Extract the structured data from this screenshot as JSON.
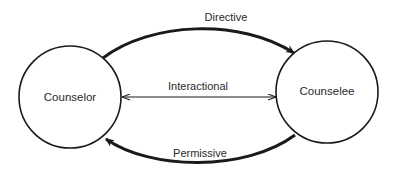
{
  "diagram": {
    "nodes": [
      {
        "id": "counselor",
        "label": "Counselor"
      },
      {
        "id": "counselee",
        "label": "Counselee"
      }
    ],
    "edges": [
      {
        "id": "directive",
        "label": "Directive",
        "from": "counselor",
        "to": "counselee",
        "style": "thick-arc-top"
      },
      {
        "id": "interactional",
        "label": "Interactional",
        "from": "counselor",
        "to": "counselee",
        "style": "thin-double-headed"
      },
      {
        "id": "permissive",
        "label": "Permissive",
        "from": "counselee",
        "to": "counselor",
        "style": "thick-arc-bottom"
      }
    ],
    "colors": {
      "stroke": "#1a1a1a",
      "background": "#ffffff",
      "text": "#2a2a2a"
    }
  }
}
